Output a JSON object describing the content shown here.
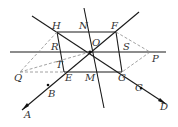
{
  "diagram": {
    "type": "geometry-figure",
    "points": {
      "O": {
        "label": "O",
        "x": 90,
        "y": 52
      },
      "H": {
        "label": "H",
        "x": 57,
        "y": 32
      },
      "N": {
        "label": "N",
        "x": 84,
        "y": 32
      },
      "F": {
        "label": "F",
        "x": 116,
        "y": 32
      },
      "R": {
        "label": "R",
        "x": 61,
        "y": 52
      },
      "S": {
        "label": "S",
        "x": 119,
        "y": 52
      },
      "P": {
        "label": "P",
        "x": 150,
        "y": 52
      },
      "Q": {
        "label": "Q",
        "x": 20,
        "y": 72
      },
      "T": {
        "label": "T",
        "x": 63,
        "y": 64
      },
      "E": {
        "label": "E",
        "x": 64,
        "y": 72
      },
      "M": {
        "label": "M",
        "x": 96,
        "y": 72
      },
      "G": {
        "label": "G",
        "x": 122,
        "y": 72
      },
      "B": {
        "label": "B",
        "x": 48,
        "y": 86
      },
      "A": {
        "label": "A",
        "x": 25,
        "y": 106
      },
      "C": {
        "label": "C",
        "x": 140,
        "y": 84
      },
      "D": {
        "label": "D",
        "x": 163,
        "y": 99
      }
    },
    "labels": [
      "H",
      "N",
      "F",
      "O",
      "R",
      "S",
      "P",
      "Q",
      "T",
      "E",
      "M",
      "G",
      "B",
      "C",
      "A",
      "D"
    ]
  }
}
